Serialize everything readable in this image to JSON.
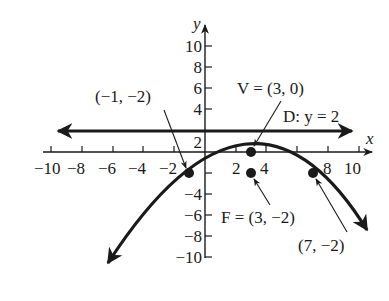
{
  "diagram": {
    "type": "parabola-graph",
    "equation_note": "Parabola opening downward with vertex V, focus F, directrix D",
    "axes": {
      "x_label": "x",
      "y_label": "y",
      "x_ticks": [
        "−10",
        "−8",
        "−6",
        "−4",
        "−2",
        "2",
        "4",
        "8",
        "10"
      ],
      "y_ticks": [
        "10",
        "8",
        "6",
        "4",
        "2",
        "−4",
        "−6",
        "−8",
        "−10"
      ],
      "x_range": [
        -10,
        10
      ],
      "y_range": [
        -10,
        10
      ]
    },
    "labels": {
      "vertex": "V = (3, 0)",
      "vertex_point": [
        3,
        0
      ],
      "directrix": "D: y = 2",
      "directrix_value": 2,
      "focus": "F = (3, −2)",
      "focus_point": [
        3,
        -2
      ],
      "left_point": "(−1, −2)",
      "left_point_xy": [
        -1,
        -2
      ],
      "right_point": "(7, −2)",
      "right_point_xy": [
        7,
        -2
      ]
    },
    "colors": {
      "ink": "#1a1a1a",
      "background": "#ffffff"
    }
  }
}
